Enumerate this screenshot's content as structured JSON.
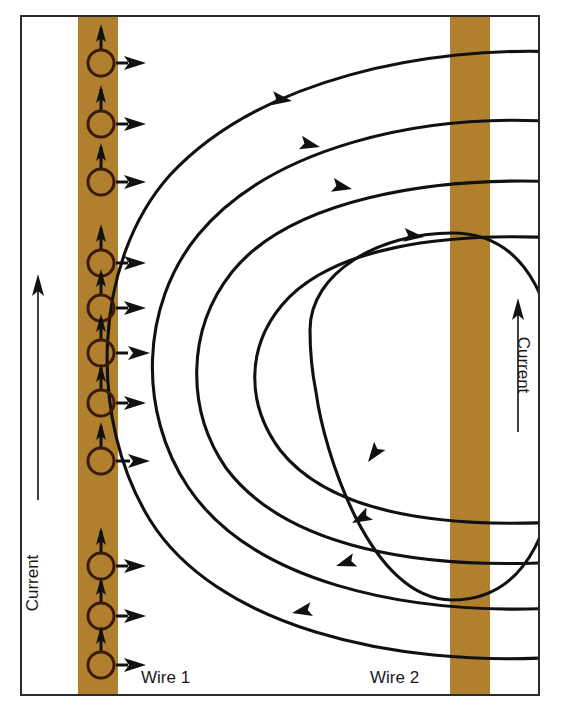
{
  "figure": {
    "background_color": "#ffffff",
    "border_color": "#2b2b2b",
    "wire_color": "#b0802f",
    "line_color": "#111111"
  },
  "labels": {
    "wire1": "Wire 1",
    "wire2": "Wire 2",
    "current_left": "Current",
    "current_right": "Current"
  },
  "wires": [
    {
      "name": "Wire 1",
      "label": "Wire 1",
      "x_left": 78,
      "x_right": 118,
      "current_direction": "up",
      "color": "#b0802f"
    },
    {
      "name": "Wire 2",
      "label": "Wire 2",
      "x_left": 450,
      "x_right": 490,
      "current_direction": "up",
      "color": "#b0802f"
    }
  ],
  "current_arrows": [
    {
      "name": "current-arrow-left",
      "x": 38,
      "y_bottom": 500,
      "y_top": 276,
      "direction": "up",
      "label": "Current"
    },
    {
      "name": "current-arrow-right",
      "x": 518,
      "y_bottom": 432,
      "y_top": 300,
      "direction": "up",
      "label": "Current"
    }
  ],
  "compasses": {
    "count": 11,
    "cx": 101,
    "radius": 13,
    "needle_direction": "up",
    "field_arrow_direction": "right",
    "cy_values": [
      63,
      124,
      182,
      263,
      308,
      353,
      403,
      461,
      566,
      616,
      665
    ]
  },
  "field_lines": {
    "circulation": "clockwise around Wire 1",
    "arrowhead_direction_top": "left",
    "arrowhead_direction_bottom": "right",
    "count": 5,
    "loops": [
      {
        "index": 1,
        "rx": 330,
        "ry": 330,
        "closed": false,
        "label": "outermost"
      },
      {
        "index": 2,
        "rx": 290,
        "ry": 290,
        "closed": false,
        "label": "outer"
      },
      {
        "index": 3,
        "rx": 240,
        "ry": 250,
        "closed": false,
        "label": "middle"
      },
      {
        "index": 4,
        "rx": 185,
        "ry": 215,
        "closed": false,
        "label": "inner"
      },
      {
        "index": 5,
        "rx": 118,
        "ry": 185,
        "closed": true,
        "label": "innermost"
      }
    ]
  },
  "frame": {
    "x": 20,
    "y": 15,
    "width": 520,
    "height": 681
  }
}
